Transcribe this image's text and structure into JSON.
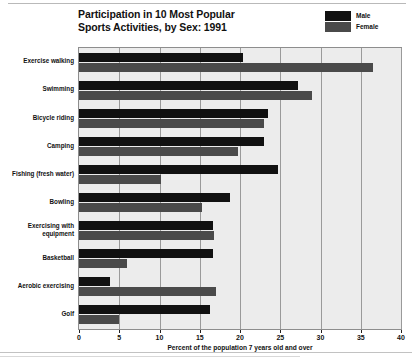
{
  "chart_data": {
    "type": "bar",
    "orientation": "horizontal",
    "title": "Participation in 10 Most Popular Sports Activities, by Sex: 1991",
    "title_lines": [
      "Participation in 10 Most Popular",
      "Sports Activities, by Sex: 1991"
    ],
    "xlabel": "Percent of the population 7 years old and over",
    "ylabel": "",
    "xlim": [
      0,
      40
    ],
    "xticks": [
      0,
      5,
      10,
      15,
      20,
      25,
      30,
      35,
      40
    ],
    "xtick_labels": [
      "0",
      "5",
      "10",
      "15",
      "20",
      "25",
      "30",
      "35",
      "40"
    ],
    "grid": true,
    "grid_axis": "x",
    "legend_position": "top-right",
    "categories": [
      "Exercise walking",
      "Swimming",
      "Bicycle riding",
      "Camping",
      "Fishing (fresh water)",
      "Bowling",
      "Exercising with equipment",
      "Basketball",
      "Aerobic exercising",
      "Golf"
    ],
    "category_label_lines": [
      [
        "Exercise walking"
      ],
      [
        "Swimming"
      ],
      [
        "Bicycle riding"
      ],
      [
        "Camping"
      ],
      [
        "Fishing (fresh water)"
      ],
      [
        "Bowling"
      ],
      [
        "Exercising with",
        "equipment"
      ],
      [
        "Basketball"
      ],
      [
        "Aerobic exercising"
      ],
      [
        "Golf"
      ]
    ],
    "series": [
      {
        "name": "Male",
        "color": "#111111",
        "values": [
          20.4,
          27.2,
          23.5,
          23.0,
          24.7,
          18.7,
          16.6,
          16.7,
          3.9,
          16.3
        ]
      },
      {
        "name": "Female",
        "color": "#4a4a4a",
        "values": [
          36.5,
          29.0,
          23.0,
          19.8,
          10.2,
          15.3,
          16.8,
          6.0,
          17.0,
          5.0
        ]
      }
    ]
  },
  "legend": {
    "entries": [
      {
        "label": "Male",
        "color": "#111111"
      },
      {
        "label": "Female",
        "color": "#4a4a4a"
      }
    ]
  }
}
